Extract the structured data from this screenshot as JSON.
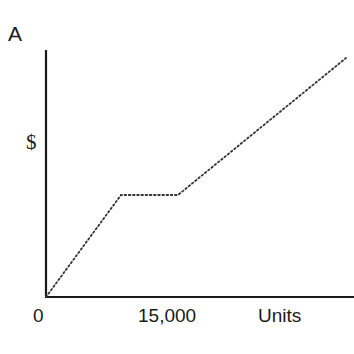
{
  "panel_label": "A",
  "chart_data": {
    "type": "line",
    "title": "",
    "xlabel": "Units",
    "ylabel": "$",
    "x_ticks": [
      "0",
      "15,000"
    ],
    "grid": false,
    "legend": null,
    "line_style": "dotted",
    "series": [
      {
        "name": "cost",
        "points_px": [
          [
            46,
            297
          ],
          [
            121,
            195
          ],
          [
            178,
            195
          ],
          [
            346,
            58
          ]
        ],
        "description": "Rises from origin, flat step (plateau) between ~10,000 and ~18,000 units, then rises linearly"
      }
    ],
    "axes": {
      "origin_px": [
        46,
        297
      ],
      "y_top_px": 50,
      "x_right_px": 354,
      "color": "#1a1a1a"
    }
  },
  "labels": {
    "tick0": "0",
    "tick15k": "15,000",
    "xlabel": "Units",
    "ylabel": "$"
  }
}
